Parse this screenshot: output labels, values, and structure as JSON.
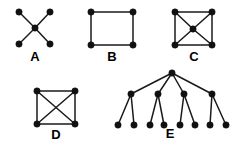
{
  "figure": {
    "background_color": "#ffffff",
    "node_color": "#111111",
    "edge_color": "#1a1a1a",
    "label_color": "#000000",
    "node_radius": 3.2,
    "edge_width": 1.5,
    "width": 241,
    "height": 150
  },
  "graphs": [
    {
      "id": "A",
      "label": "A",
      "label_pos": {
        "x": 35,
        "y": 61
      },
      "description": "star graph with one center vertex joined to four outer vertices",
      "vertex_count": 5,
      "edge_count": 4,
      "nodes": [
        {
          "id": "a1",
          "x": 19,
          "y": 12
        },
        {
          "id": "a2",
          "x": 50,
          "y": 12
        },
        {
          "id": "a3",
          "x": 19,
          "y": 44
        },
        {
          "id": "a4",
          "x": 50,
          "y": 44
        },
        {
          "id": "a0",
          "x": 35,
          "y": 28
        }
      ],
      "edges": [
        {
          "from": "a0",
          "to": "a1"
        },
        {
          "from": "a0",
          "to": "a2"
        },
        {
          "from": "a0",
          "to": "a3"
        },
        {
          "from": "a0",
          "to": "a4"
        }
      ]
    },
    {
      "id": "B",
      "label": "B",
      "label_pos": {
        "x": 112,
        "y": 61
      },
      "description": "four-cycle square with no diagonals",
      "vertex_count": 4,
      "edge_count": 4,
      "nodes": [
        {
          "id": "b1",
          "x": 91,
          "y": 12
        },
        {
          "id": "b2",
          "x": 133,
          "y": 12
        },
        {
          "id": "b3",
          "x": 91,
          "y": 45
        },
        {
          "id": "b4",
          "x": 133,
          "y": 45
        }
      ],
      "edges": [
        {
          "from": "b1",
          "to": "b2"
        },
        {
          "from": "b2",
          "to": "b4"
        },
        {
          "from": "b4",
          "to": "b3"
        },
        {
          "from": "b3",
          "to": "b1"
        }
      ]
    },
    {
      "id": "C",
      "label": "C",
      "label_pos": {
        "x": 194,
        "y": 61
      },
      "description": "wheel graph: square outline plus a center vertex joined to all four corners",
      "vertex_count": 5,
      "edge_count": 8,
      "nodes": [
        {
          "id": "c1",
          "x": 175,
          "y": 12
        },
        {
          "id": "c2",
          "x": 212,
          "y": 12
        },
        {
          "id": "c3",
          "x": 175,
          "y": 45
        },
        {
          "id": "c4",
          "x": 212,
          "y": 45
        },
        {
          "id": "c0",
          "x": 193,
          "y": 29
        }
      ],
      "edges": [
        {
          "from": "c1",
          "to": "c2"
        },
        {
          "from": "c2",
          "to": "c4"
        },
        {
          "from": "c4",
          "to": "c3"
        },
        {
          "from": "c3",
          "to": "c1"
        },
        {
          "from": "c0",
          "to": "c1"
        },
        {
          "from": "c0",
          "to": "c2"
        },
        {
          "from": "c0",
          "to": "c3"
        },
        {
          "from": "c0",
          "to": "c4"
        }
      ]
    },
    {
      "id": "D",
      "label": "D",
      "label_pos": {
        "x": 56,
        "y": 139
      },
      "description": "complete graph on four vertices: square with both diagonals",
      "vertex_count": 4,
      "edge_count": 6,
      "nodes": [
        {
          "id": "d1",
          "x": 37,
          "y": 91
        },
        {
          "id": "d2",
          "x": 75,
          "y": 91
        },
        {
          "id": "d3",
          "x": 37,
          "y": 124
        },
        {
          "id": "d4",
          "x": 75,
          "y": 124
        }
      ],
      "edges": [
        {
          "from": "d1",
          "to": "d2"
        },
        {
          "from": "d2",
          "to": "d4"
        },
        {
          "from": "d4",
          "to": "d3"
        },
        {
          "from": "d3",
          "to": "d1"
        },
        {
          "from": "d1",
          "to": "d4"
        },
        {
          "from": "d2",
          "to": "d3"
        }
      ]
    },
    {
      "id": "E",
      "label": "E",
      "label_pos": {
        "x": 170,
        "y": 138
      },
      "description": "rooted tree: root with four children, each child having two leaves",
      "vertex_count": 13,
      "edge_count": 12,
      "nodes": [
        {
          "id": "e0",
          "x": 172,
          "y": 73
        },
        {
          "id": "e1",
          "x": 131,
          "y": 94
        },
        {
          "id": "e2",
          "x": 158,
          "y": 94
        },
        {
          "id": "e3",
          "x": 184,
          "y": 94
        },
        {
          "id": "e4",
          "x": 212,
          "y": 94
        },
        {
          "id": "e11",
          "x": 118,
          "y": 125
        },
        {
          "id": "e12",
          "x": 134,
          "y": 125
        },
        {
          "id": "e21",
          "x": 150,
          "y": 125
        },
        {
          "id": "e22",
          "x": 164,
          "y": 125
        },
        {
          "id": "e31",
          "x": 180,
          "y": 125
        },
        {
          "id": "e32",
          "x": 195,
          "y": 125
        },
        {
          "id": "e41",
          "x": 210,
          "y": 125
        },
        {
          "id": "e42",
          "x": 226,
          "y": 125
        }
      ],
      "edges": [
        {
          "from": "e0",
          "to": "e1"
        },
        {
          "from": "e0",
          "to": "e2"
        },
        {
          "from": "e0",
          "to": "e3"
        },
        {
          "from": "e0",
          "to": "e4"
        },
        {
          "from": "e1",
          "to": "e11"
        },
        {
          "from": "e1",
          "to": "e12"
        },
        {
          "from": "e2",
          "to": "e21"
        },
        {
          "from": "e2",
          "to": "e22"
        },
        {
          "from": "e3",
          "to": "e31"
        },
        {
          "from": "e3",
          "to": "e32"
        },
        {
          "from": "e4",
          "to": "e41"
        },
        {
          "from": "e4",
          "to": "e42"
        }
      ]
    }
  ]
}
